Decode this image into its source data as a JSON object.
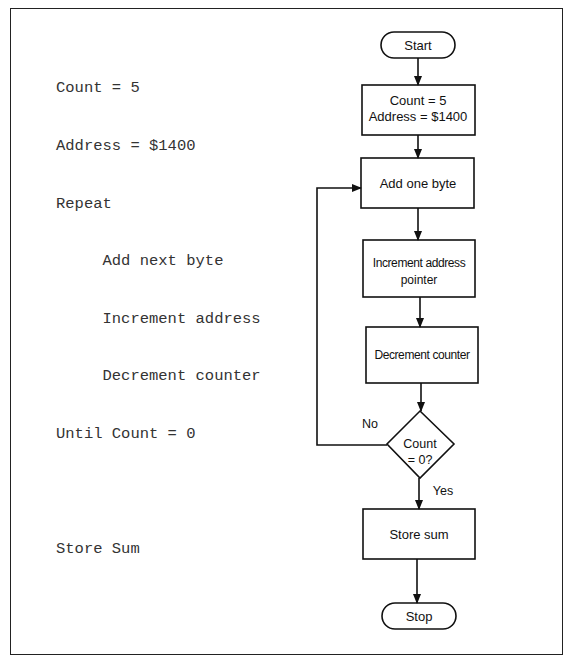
{
  "pseudocode": {
    "lines": [
      "Count = 5",
      "Address = $1400",
      "Repeat",
      "     Add next byte",
      "     Increment address",
      "     Decrement counter",
      "Until Count = 0",
      "",
      "Store Sum"
    ]
  },
  "flowchart": {
    "start": "Start",
    "init_line1": "Count = 5",
    "init_line2": "Address = $1400",
    "add": "Add one byte",
    "increment_line1": "Increment address",
    "increment_line2": "pointer",
    "decrement": "Decrement counter",
    "decision_line1": "Count",
    "decision_line2": "= 0?",
    "no_label": "No",
    "yes_label": "Yes",
    "store": "Store sum",
    "stop": "Stop"
  },
  "colors": {
    "stroke": "#111111",
    "text": "#111111",
    "code_text": "#333333",
    "background": "#ffffff"
  }
}
